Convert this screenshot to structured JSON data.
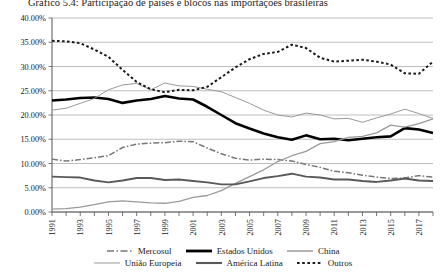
{
  "chart_data": {
    "type": "line",
    "title": "Gráfico 5.4: Participação de países e blocos nas importações brasileiras",
    "xlabel": "",
    "ylabel": "",
    "ylim": [
      0,
      0.4
    ],
    "ytick_labels": [
      "0.00%",
      "5.00%",
      "10.00%",
      "15.00%",
      "20.00%",
      "25.00%",
      "30.00%",
      "35.00%",
      "40.00%"
    ],
    "ytick_values": [
      0,
      5,
      10,
      15,
      20,
      25,
      30,
      35,
      40
    ],
    "grid": "horizontal",
    "legend_position": "bottom",
    "x": [
      1991,
      1992,
      1993,
      1994,
      1995,
      1996,
      1997,
      1998,
      1999,
      2000,
      2001,
      2002,
      2003,
      2004,
      2005,
      2006,
      2007,
      2008,
      2009,
      2010,
      2011,
      2012,
      2013,
      2014,
      2015,
      2016,
      2017,
      2018
    ],
    "xtick_labels": [
      "1991",
      "1993",
      "1995",
      "1997",
      "1999",
      "2001",
      "2003",
      "2005",
      "2007",
      "2009",
      "2011",
      "2013",
      "2015",
      "2017"
    ],
    "series": [
      {
        "name": "Mercosul",
        "style": "dash-dot",
        "color": "#777777",
        "width": 1.5,
        "values": [
          10.9,
          10.5,
          10.8,
          11.2,
          11.6,
          13.3,
          14.0,
          14.2,
          14.3,
          14.6,
          14.5,
          13.2,
          12.0,
          11.1,
          10.7,
          10.9,
          10.8,
          10.5,
          9.8,
          9.2,
          8.4,
          8.1,
          7.6,
          7.2,
          6.9,
          7.0,
          7.5,
          7.2
        ]
      },
      {
        "name": "Estados Unidos",
        "style": "solid",
        "color": "#000000",
        "width": 2.6,
        "values": [
          23.0,
          23.2,
          23.5,
          23.6,
          23.3,
          22.5,
          23.0,
          23.3,
          23.9,
          23.4,
          23.2,
          21.7,
          20.0,
          18.3,
          17.2,
          16.2,
          15.4,
          14.9,
          15.8,
          15.0,
          15.1,
          14.8,
          15.1,
          15.4,
          15.6,
          17.3,
          17.0,
          16.3
        ]
      },
      {
        "name": "China",
        "style": "solid",
        "color": "#9a9a9a",
        "width": 1.3,
        "values": [
          0.6,
          0.7,
          1.0,
          1.5,
          2.1,
          2.3,
          2.1,
          1.9,
          1.8,
          2.2,
          3.0,
          3.4,
          4.4,
          5.9,
          7.3,
          8.7,
          10.4,
          11.6,
          12.5,
          14.1,
          14.5,
          15.4,
          15.6,
          16.3,
          17.9,
          17.5,
          18.2,
          19.2
        ]
      },
      {
        "name": "União Europeia",
        "style": "solid",
        "color": "#999999",
        "width": 1.0,
        "values": [
          21.0,
          21.4,
          22.4,
          23.4,
          25.2,
          26.2,
          26.5,
          25.2,
          26.6,
          26.0,
          25.9,
          25.3,
          24.8,
          23.6,
          22.4,
          21.0,
          20.0,
          19.6,
          20.4,
          20.0,
          19.2,
          19.3,
          18.5,
          19.4,
          20.2,
          21.2,
          20.3,
          19.3
        ]
      },
      {
        "name": "América Latina",
        "style": "solid",
        "color": "#595959",
        "width": 1.9,
        "values": [
          7.3,
          7.2,
          7.1,
          6.5,
          6.1,
          6.5,
          7.0,
          7.0,
          6.6,
          6.7,
          6.4,
          6.1,
          5.7,
          5.7,
          6.3,
          7.0,
          7.4,
          7.9,
          7.3,
          7.1,
          6.7,
          6.7,
          6.4,
          6.2,
          6.5,
          6.9,
          6.5,
          6.4
        ]
      },
      {
        "name": "Outros",
        "style": "dotted",
        "color": "#1a1a1a",
        "width": 2.0,
        "values": [
          35.3,
          35.2,
          34.8,
          33.5,
          32.0,
          29.3,
          26.8,
          25.3,
          24.7,
          25.2,
          25.1,
          25.8,
          27.8,
          29.8,
          31.5,
          32.6,
          33.0,
          34.5,
          33.8,
          31.8,
          31.0,
          31.2,
          31.4,
          31.0,
          30.4,
          28.6,
          28.5,
          31.0
        ]
      }
    ]
  },
  "legend": {
    "rows": [
      [
        {
          "label": "Mercosul",
          "style": "dash-dot"
        },
        {
          "label": "Estados Unidos",
          "style": "thick-solid"
        },
        {
          "label": "China",
          "style": "gray-solid"
        }
      ],
      [
        {
          "label": "União Europeia",
          "style": "thin-solid"
        },
        {
          "label": "América Latina",
          "style": "medium-solid"
        },
        {
          "label": "Outros",
          "style": "dotted"
        }
      ]
    ]
  }
}
